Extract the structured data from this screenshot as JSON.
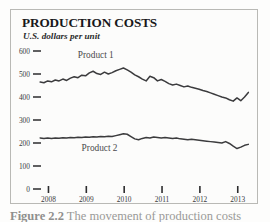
{
  "figure": {
    "title": "PRODUCTION COSTS",
    "subtitle": "U.S. dollars per unit",
    "caption_partial": "Figure 2.2",
    "caption_rest": "The movement of production costs"
  },
  "colors": {
    "line": "#3b3b3d",
    "text": "#3a3a3c",
    "title": "#18181a",
    "frame": "#b9b9b5",
    "background": "#fcfcfb"
  },
  "chart_data": {
    "type": "line",
    "title": "PRODUCTION COSTS",
    "subtitle": "U.S. dollars per unit",
    "xlabel": "",
    "ylabel": "U.S. dollars per unit",
    "ylim": [
      0,
      600
    ],
    "yticks": [
      0,
      100,
      200,
      300,
      400,
      500,
      600
    ],
    "ytick_labels": [
      "0",
      "100",
      "200",
      "300",
      "400",
      "500",
      "600"
    ],
    "xticks": [
      2008,
      2009,
      2010,
      2011,
      2012,
      2013
    ],
    "xtick_labels": [
      "2008",
      "2009",
      "2010",
      "2011",
      "2012",
      "2013"
    ],
    "xlim": [
      2007.75,
      2013.35
    ],
    "grid": false,
    "legend": "inline-labels",
    "series": [
      {
        "name": "Product 1",
        "label_x": 2009.25,
        "label_y": 570,
        "x": [
          2007.78,
          2007.88,
          2007.98,
          2008.08,
          2008.18,
          2008.28,
          2008.38,
          2008.48,
          2008.58,
          2008.68,
          2008.78,
          2008.88,
          2008.98,
          2009.08,
          2009.18,
          2009.28,
          2009.38,
          2009.48,
          2009.58,
          2009.68,
          2009.78,
          2009.88,
          2009.98,
          2010.08,
          2010.18,
          2010.28,
          2010.38,
          2010.48,
          2010.58,
          2010.68,
          2010.78,
          2010.88,
          2010.98,
          2011.08,
          2011.18,
          2011.28,
          2011.38,
          2011.48,
          2011.58,
          2011.68,
          2011.78,
          2011.88,
          2011.98,
          2012.08,
          2012.18,
          2012.28,
          2012.38,
          2012.48,
          2012.58,
          2012.68,
          2012.78,
          2012.88,
          2012.98,
          2013.08,
          2013.18,
          2013.28
        ],
        "values": [
          465,
          462,
          470,
          466,
          474,
          470,
          478,
          472,
          482,
          488,
          484,
          495,
          492,
          505,
          512,
          502,
          498,
          508,
          500,
          506,
          514,
          520,
          526,
          518,
          508,
          496,
          488,
          478,
          470,
          490,
          484,
          470,
          476,
          468,
          458,
          452,
          456,
          450,
          444,
          448,
          442,
          438,
          434,
          428,
          424,
          418,
          412,
          406,
          400,
          396,
          388,
          382,
          396,
          384,
          400,
          420
        ]
      },
      {
        "name": "Product 2",
        "label_x": 2009.35,
        "label_y": 165,
        "x": [
          2007.78,
          2007.88,
          2007.98,
          2008.08,
          2008.18,
          2008.28,
          2008.38,
          2008.48,
          2008.58,
          2008.68,
          2008.78,
          2008.88,
          2008.98,
          2009.08,
          2009.18,
          2009.28,
          2009.38,
          2009.48,
          2009.58,
          2009.68,
          2009.78,
          2009.88,
          2009.98,
          2010.08,
          2010.18,
          2010.28,
          2010.38,
          2010.48,
          2010.58,
          2010.68,
          2010.78,
          2010.88,
          2010.98,
          2011.08,
          2011.18,
          2011.28,
          2011.38,
          2011.48,
          2011.58,
          2011.68,
          2011.78,
          2011.88,
          2011.98,
          2012.08,
          2012.18,
          2012.28,
          2012.38,
          2012.48,
          2012.58,
          2012.68,
          2012.78,
          2012.88,
          2012.98,
          2013.08,
          2013.18,
          2013.28
        ],
        "values": [
          222,
          220,
          222,
          220,
          222,
          221,
          223,
          222,
          224,
          223,
          225,
          224,
          226,
          225,
          227,
          226,
          228,
          227,
          229,
          228,
          232,
          236,
          240,
          238,
          228,
          218,
          214,
          220,
          224,
          222,
          226,
          224,
          222,
          224,
          222,
          220,
          222,
          218,
          216,
          214,
          216,
          214,
          212,
          210,
          208,
          206,
          204,
          202,
          200,
          206,
          198,
          186,
          176,
          182,
          190,
          194
        ]
      }
    ]
  }
}
